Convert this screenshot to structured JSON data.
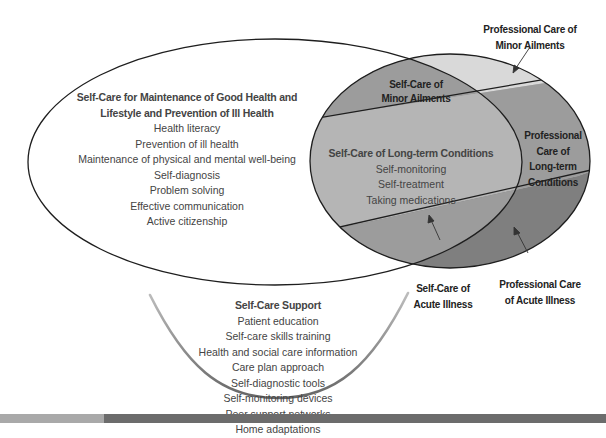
{
  "diagram": {
    "colors": {
      "minor_ailments_fill": "#d9d9d9",
      "long_term_fill": "#b5b5b5",
      "professional_long_term_fill": "#9c9c9c",
      "acute_fill": "#7f7f7f",
      "outline": "#1e1e1e",
      "support_curve": "#6f6f6f",
      "bar_light": "#a9a9a9",
      "bar_dark": "#6c6c6c"
    },
    "maintenance": {
      "title_line1": "Self-Care for Maintenance of Good Health and",
      "title_line2": "Lifestyle and Prevention of Ill Health",
      "items": [
        "Health literacy",
        "Prevention of ill health",
        "Maintenance of physical and mental well-being",
        "Self-diagnosis",
        "Problem solving",
        "Effective communication",
        "Active citizenship"
      ]
    },
    "minor_ailments": {
      "line1": "Self-Care of",
      "line2": "Minor Ailments"
    },
    "long_term": {
      "title": "Self-Care of Long-term Conditions",
      "items": [
        "Self-monitoring",
        "Self-treatment",
        "Taking medications"
      ]
    },
    "professional_long_term": {
      "lines": [
        "Professional",
        "Care of",
        "Long-term",
        "Conditions"
      ]
    },
    "professional_minor": {
      "line1": "Professional Care of",
      "line2": "Minor Ailments"
    },
    "self_acute": {
      "line1": "Self-Care of",
      "line2": "Acute Illness"
    },
    "professional_acute": {
      "line1": "Professional Care",
      "line2": "of Acute Illness"
    },
    "support": {
      "title": "Self-Care Support",
      "items": [
        "Patient education",
        "Self-care skills training",
        "Health and social care information",
        "Care plan approach",
        "Self-diagnostic tools",
        "Self-monitoring devices",
        "Peer support networks",
        "Home adaptations"
      ]
    }
  }
}
